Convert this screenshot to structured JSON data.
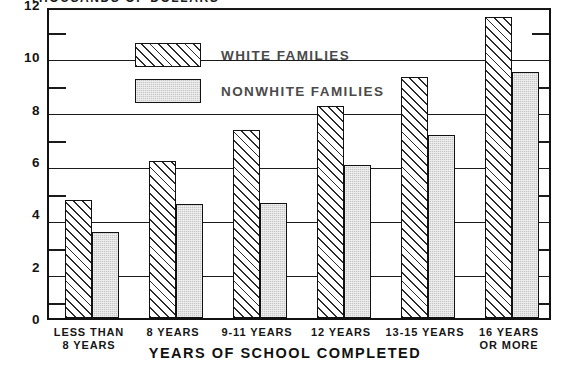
{
  "chart_data": {
    "type": "bar",
    "title": "THOUSANDS OF DOLLARS",
    "xlabel": "YEARS OF SCHOOL COMPLETED",
    "ylabel": "",
    "categories": [
      "LESS THAN\n8 YEARS",
      "8 YEARS",
      "9-11 YEARS",
      "12 YEARS",
      "13-15 YEARS",
      "16 YEARS\nOR MORE"
    ],
    "series": [
      {
        "name": "WHITE FAMILIES",
        "values": [
          4.5,
          6.0,
          7.2,
          8.1,
          9.2,
          11.5
        ]
      },
      {
        "name": "NONWHITE FAMILIES",
        "values": [
          3.3,
          4.35,
          4.4,
          5.85,
          7.0,
          9.4
        ]
      }
    ],
    "ylim": [
      0,
      12
    ],
    "yticks": [
      0,
      2,
      4,
      6,
      8,
      10,
      12
    ],
    "yticks_minor": [
      1,
      3,
      5,
      7,
      9,
      11
    ],
    "ytick_labels": [
      "0",
      "2",
      "4",
      "6",
      "8",
      "10",
      "12"
    ],
    "grid": true,
    "legend_position": "upper-left-inside"
  },
  "legend": {
    "entries": [
      {
        "label": "WHITE FAMILIES",
        "pattern": "diagonal-hatch"
      },
      {
        "label": "NONWHITE FAMILIES",
        "pattern": "gray-stipple"
      }
    ]
  },
  "colors": {
    "ink": "#111111",
    "white_bar_fill": "#ffffff",
    "nonwhite_bar_fill": "#c9c9c9",
    "legend_text": "#4a4a4a",
    "background": "#ffffff"
  }
}
